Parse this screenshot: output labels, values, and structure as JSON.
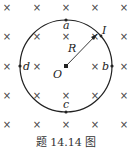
{
  "figure": {
    "caption": "题 14.14 图",
    "field_symbol": "×",
    "field_grid": {
      "columns_x": [
        7,
        37,
        66,
        95,
        124
      ],
      "rows_y": [
        7,
        36,
        66,
        95,
        124
      ]
    },
    "circle": {
      "cx": 66,
      "cy": 66,
      "r": 46
    },
    "labels": {
      "a": "a",
      "b": "b",
      "c": "c",
      "d": "d",
      "center": "O",
      "radius": "R",
      "current": "I"
    },
    "colors": {
      "ink": "#222222",
      "cross": "#444444"
    }
  }
}
